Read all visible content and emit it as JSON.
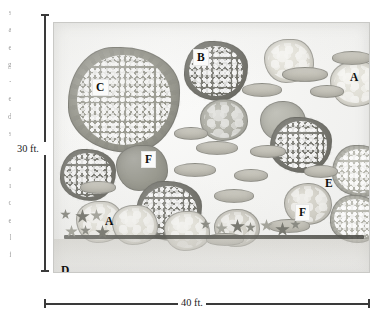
{
  "figure": {
    "type": "planting-plan-elevation",
    "medium": "grayscale watercolor illustration",
    "scale": {
      "vertical_label": "30 ft.",
      "horizontal_label": "40 ft."
    }
  },
  "margin_text": {
    "note": "cropped sliver of body text at the far left edge of the page",
    "lines": [
      "s",
      "a",
      "e",
      "g",
      "-",
      "e",
      "d",
      "s",
      "n",
      "a",
      "r",
      "c",
      "e",
      "l",
      "f"
    ]
  },
  "keys": [
    {
      "id": "k1",
      "label": "C",
      "boxed": true,
      "x": 91,
      "y": 78
    },
    {
      "id": "k2",
      "label": "B",
      "boxed": true,
      "x": 192,
      "y": 48
    },
    {
      "id": "k3",
      "label": "A",
      "boxed": false,
      "x": 349,
      "y": 71
    },
    {
      "id": "k4",
      "label": "F",
      "boxed": true,
      "x": 140,
      "y": 150
    },
    {
      "id": "k5",
      "label": "E",
      "boxed": false,
      "x": 324,
      "y": 177
    },
    {
      "id": "k6",
      "label": "F",
      "boxed": true,
      "x": 294,
      "y": 203
    },
    {
      "id": "k7",
      "label": "A",
      "boxed": false,
      "x": 104,
      "y": 215
    },
    {
      "id": "k8",
      "label": "D",
      "boxed": false,
      "x": 60,
      "y": 264
    },
    {
      "id": "k9",
      "label": "D",
      "boxed": false,
      "x": 281,
      "y": 271
    }
  ],
  "canopies": [
    {
      "id": "c-main",
      "key": "C",
      "shape": "lobed",
      "tone": "mid",
      "speckle": "dense",
      "x": 14,
      "y": 24,
      "w": 112,
      "h": 106
    },
    {
      "id": "c-b",
      "key": "B",
      "shape": "lobed",
      "tone": "dark",
      "speckle": "dense",
      "x": 130,
      "y": 18,
      "w": 64,
      "h": 60
    },
    {
      "id": "c-a-top",
      "key": "A",
      "shape": "puff",
      "tone": "pale",
      "speckle": "sparse",
      "x": 210,
      "y": 16,
      "w": 50,
      "h": 44
    },
    {
      "id": "c-a-rt",
      "key": "A",
      "shape": "puff",
      "tone": "pale",
      "speckle": "sparse",
      "x": 276,
      "y": 38,
      "w": 52,
      "h": 46
    },
    {
      "id": "c-m1",
      "key": "",
      "shape": "round",
      "tone": "midlt",
      "speckle": "sparse",
      "x": 146,
      "y": 76,
      "w": 48,
      "h": 42
    },
    {
      "id": "c-m2",
      "key": "",
      "shape": "round",
      "tone": "midlt",
      "speckle": "none",
      "x": 206,
      "y": 78,
      "w": 46,
      "h": 40
    },
    {
      "id": "c-dk1",
      "key": "",
      "shape": "lobed",
      "tone": "dark",
      "speckle": "dense",
      "x": 216,
      "y": 94,
      "w": 62,
      "h": 56
    },
    {
      "id": "c-e",
      "key": "E",
      "shape": "lobed",
      "tone": "midlt",
      "speckle": "dense",
      "x": 278,
      "y": 122,
      "w": 56,
      "h": 52
    },
    {
      "id": "c-f1",
      "key": "F",
      "shape": "puff",
      "tone": "mid",
      "speckle": "none",
      "x": 62,
      "y": 122,
      "w": 52,
      "h": 46
    },
    {
      "id": "c-dk2",
      "key": "",
      "shape": "lobed",
      "tone": "dark",
      "speckle": "dense",
      "x": 6,
      "y": 126,
      "w": 56,
      "h": 52
    },
    {
      "id": "c-dk3",
      "key": "",
      "shape": "lobed",
      "tone": "dark",
      "speckle": "dense",
      "x": 82,
      "y": 158,
      "w": 66,
      "h": 60
    },
    {
      "id": "c-f2",
      "key": "F",
      "shape": "round",
      "tone": "light",
      "speckle": "sparse",
      "x": 230,
      "y": 160,
      "w": 48,
      "h": 42
    },
    {
      "id": "c-lt1",
      "key": "",
      "shape": "puff",
      "tone": "pale",
      "speckle": "sparse",
      "x": 22,
      "y": 178,
      "w": 48,
      "h": 42
    },
    {
      "id": "c-a-low",
      "key": "A",
      "shape": "puff",
      "tone": "pale",
      "speckle": "sparse",
      "x": 58,
      "y": 182,
      "w": 46,
      "h": 40
    },
    {
      "id": "c-lt2",
      "key": "",
      "shape": "puff",
      "tone": "pale",
      "speckle": "sparse",
      "x": 110,
      "y": 188,
      "w": 46,
      "h": 40
    },
    {
      "id": "c-lt3",
      "key": "",
      "shape": "round",
      "tone": "light",
      "speckle": "sparse",
      "x": 160,
      "y": 186,
      "w": 46,
      "h": 38
    },
    {
      "id": "c-rt1",
      "key": "",
      "shape": "lobed",
      "tone": "midlt",
      "speckle": "dense",
      "x": 276,
      "y": 172,
      "w": 52,
      "h": 48
    }
  ],
  "shrub_bands": [
    {
      "id": "b1",
      "x": 228,
      "y": 44,
      "w": 46,
      "h": 15
    },
    {
      "id": "b2",
      "x": 278,
      "y": 28,
      "w": 40,
      "h": 14
    },
    {
      "id": "b3",
      "x": 188,
      "y": 60,
      "w": 40,
      "h": 14
    },
    {
      "id": "b4",
      "x": 142,
      "y": 118,
      "w": 42,
      "h": 14
    },
    {
      "id": "b5",
      "x": 196,
      "y": 122,
      "w": 36,
      "h": 13
    },
    {
      "id": "b6",
      "x": 120,
      "y": 104,
      "w": 34,
      "h": 13
    },
    {
      "id": "b7",
      "x": 120,
      "y": 140,
      "w": 42,
      "h": 14
    },
    {
      "id": "b8",
      "x": 180,
      "y": 146,
      "w": 34,
      "h": 13
    },
    {
      "id": "b9",
      "x": 26,
      "y": 158,
      "w": 36,
      "h": 13
    },
    {
      "id": "b10",
      "x": 160,
      "y": 166,
      "w": 40,
      "h": 14
    },
    {
      "id": "b11",
      "x": 250,
      "y": 142,
      "w": 34,
      "h": 13
    },
    {
      "id": "b12",
      "x": 214,
      "y": 196,
      "w": 42,
      "h": 14
    },
    {
      "id": "b13",
      "x": 256,
      "y": 62,
      "w": 34,
      "h": 13
    },
    {
      "id": "b14",
      "x": 152,
      "y": 210,
      "w": 38,
      "h": 13
    }
  ],
  "ground_flowers": {
    "cluster_left": {
      "count": 6,
      "x": 6,
      "y": 186
    },
    "cluster_right": {
      "count": 7,
      "x": 146,
      "y": 196
    }
  }
}
